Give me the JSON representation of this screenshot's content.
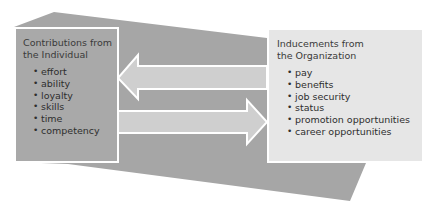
{
  "colors": {
    "background_shape": "#a6a6a6",
    "arrow_fill": "#cfcfcf",
    "arrow_stroke": "#ffffff",
    "left_box": "#a9a9a9",
    "right_box": "#e6e6e6"
  },
  "left_box": {
    "title_line1": "Contributions from",
    "title_line2": "the Individual",
    "items": [
      "effort",
      "ability",
      "loyalty",
      "skills",
      "time",
      "competency"
    ]
  },
  "right_box": {
    "title_line1": "Inducements from",
    "title_line2": "the Organization",
    "items": [
      "pay",
      "benefits",
      "job security",
      "status",
      "promotion opportunities",
      "career opportunities"
    ]
  },
  "arrows": [
    {
      "direction": "left",
      "from": "Organization",
      "to": "Individual"
    },
    {
      "direction": "right",
      "from": "Individual",
      "to": "Organization"
    }
  ]
}
